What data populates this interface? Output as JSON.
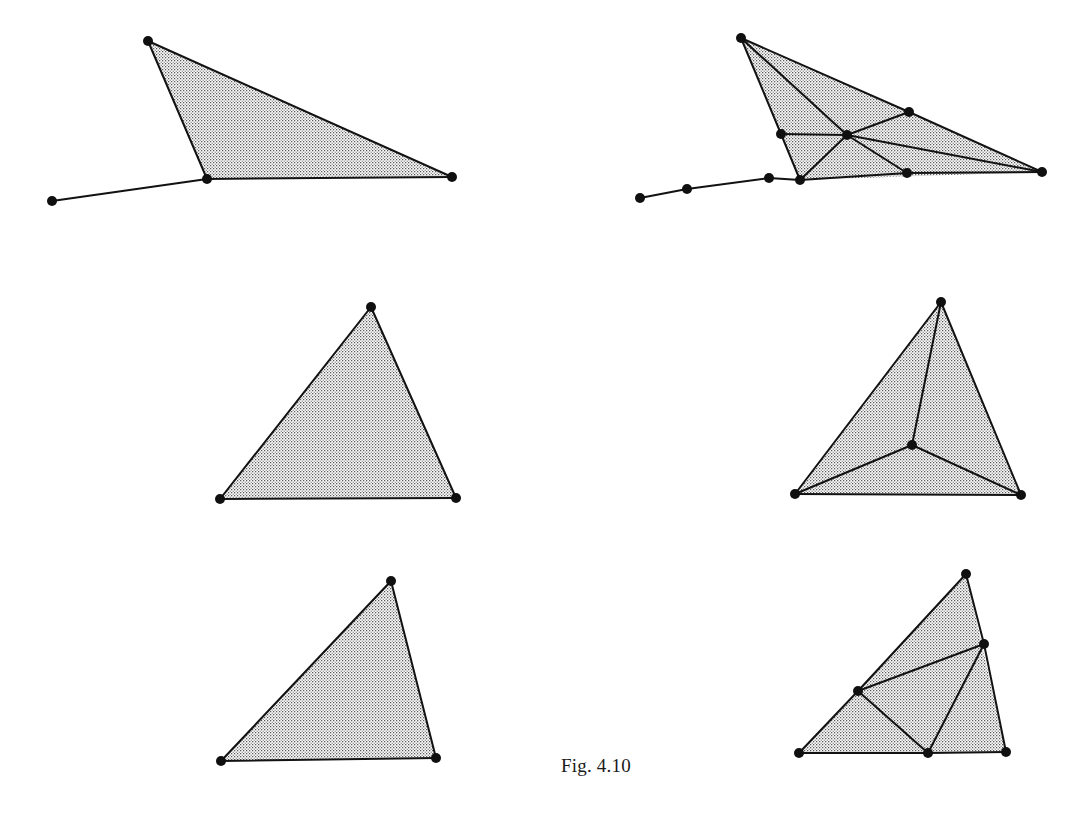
{
  "figure": {
    "caption": "Fig. 4.10",
    "caption_x": 561,
    "caption_y": 755,
    "width": 1075,
    "height": 816,
    "background_color": "#ffffff",
    "edge_color": "#121212",
    "vertex_color": "#101010",
    "fill_pattern": "stipple-dots",
    "fill_dot_color": "#3a3a3a",
    "fill_base_color": "#ffffff",
    "edge_width": 2.0,
    "vertex_radius": 5.0
  },
  "panels": [
    {
      "name": "top-left-coarse-triangle",
      "row": 1,
      "column": "left",
      "kind": "coarse",
      "vertices": [
        {
          "id": "a",
          "x": 148,
          "y": 41
        },
        {
          "id": "b",
          "x": 207,
          "y": 179
        },
        {
          "id": "c",
          "x": 452,
          "y": 177
        },
        {
          "id": "d",
          "x": 52,
          "y": 201
        }
      ],
      "faces": [
        {
          "id": "f1",
          "vertex_ids": [
            "a",
            "b",
            "c"
          ]
        }
      ],
      "edges": [
        {
          "from": "a",
          "to": "b"
        },
        {
          "from": "b",
          "to": "c"
        },
        {
          "from": "c",
          "to": "a"
        },
        {
          "from": "d",
          "to": "b"
        }
      ]
    },
    {
      "name": "top-right-refined-triangle",
      "row": 1,
      "column": "right",
      "kind": "refined",
      "vertices": [
        {
          "id": "a",
          "x": 741,
          "y": 38
        },
        {
          "id": "b",
          "x": 800,
          "y": 180
        },
        {
          "id": "c",
          "x": 1042,
          "y": 172
        },
        {
          "id": "m_ab",
          "x": 781,
          "y": 134
        },
        {
          "id": "m_ac",
          "x": 909,
          "y": 112
        },
        {
          "id": "m_bc",
          "x": 907,
          "y": 173
        },
        {
          "id": "hub",
          "x": 847,
          "y": 135
        },
        {
          "id": "t1",
          "x": 769,
          "y": 178
        },
        {
          "id": "t2",
          "x": 687,
          "y": 189
        },
        {
          "id": "t3",
          "x": 640,
          "y": 198
        }
      ],
      "faces": [
        {
          "id": "f1",
          "vertex_ids": [
            "a",
            "b",
            "c"
          ]
        }
      ],
      "edges": [
        {
          "from": "a",
          "to": "m_ab"
        },
        {
          "from": "m_ab",
          "to": "b"
        },
        {
          "from": "b",
          "to": "m_bc"
        },
        {
          "from": "m_bc",
          "to": "c"
        },
        {
          "from": "c",
          "to": "m_ac"
        },
        {
          "from": "m_ac",
          "to": "a"
        },
        {
          "from": "a",
          "to": "hub"
        },
        {
          "from": "b",
          "to": "hub"
        },
        {
          "from": "c",
          "to": "hub"
        },
        {
          "from": "m_ab",
          "to": "hub"
        },
        {
          "from": "m_ac",
          "to": "hub"
        },
        {
          "from": "m_bc",
          "to": "hub"
        },
        {
          "from": "b",
          "to": "t1"
        },
        {
          "from": "t1",
          "to": "t2"
        },
        {
          "from": "t2",
          "to": "t3"
        }
      ]
    },
    {
      "name": "middle-left-coarse-triangle",
      "row": 2,
      "column": "left",
      "kind": "coarse",
      "vertices": [
        {
          "id": "a",
          "x": 371,
          "y": 307
        },
        {
          "id": "b",
          "x": 220,
          "y": 499
        },
        {
          "id": "c",
          "x": 456,
          "y": 498
        }
      ],
      "faces": [
        {
          "id": "f1",
          "vertex_ids": [
            "a",
            "b",
            "c"
          ]
        }
      ],
      "edges": [
        {
          "from": "a",
          "to": "b"
        },
        {
          "from": "b",
          "to": "c"
        },
        {
          "from": "c",
          "to": "a"
        }
      ]
    },
    {
      "name": "middle-right-refined-triangle",
      "row": 2,
      "column": "right",
      "kind": "refined",
      "vertices": [
        {
          "id": "a",
          "x": 941,
          "y": 302
        },
        {
          "id": "b",
          "x": 795,
          "y": 494
        },
        {
          "id": "c",
          "x": 1021,
          "y": 495
        },
        {
          "id": "g",
          "x": 912,
          "y": 445
        }
      ],
      "faces": [
        {
          "id": "f1",
          "vertex_ids": [
            "a",
            "b",
            "c"
          ]
        }
      ],
      "edges": [
        {
          "from": "a",
          "to": "b"
        },
        {
          "from": "b",
          "to": "c"
        },
        {
          "from": "c",
          "to": "a"
        },
        {
          "from": "a",
          "to": "g"
        },
        {
          "from": "b",
          "to": "g"
        },
        {
          "from": "c",
          "to": "g"
        }
      ]
    },
    {
      "name": "bottom-left-coarse-triangle",
      "row": 3,
      "column": "left",
      "kind": "coarse",
      "vertices": [
        {
          "id": "a",
          "x": 391,
          "y": 581
        },
        {
          "id": "b",
          "x": 221,
          "y": 761
        },
        {
          "id": "c",
          "x": 436,
          "y": 758
        }
      ],
      "faces": [
        {
          "id": "f1",
          "vertex_ids": [
            "a",
            "b",
            "c"
          ]
        }
      ],
      "edges": [
        {
          "from": "a",
          "to": "b"
        },
        {
          "from": "b",
          "to": "c"
        },
        {
          "from": "c",
          "to": "a"
        }
      ]
    },
    {
      "name": "bottom-right-refined-triangle",
      "row": 3,
      "column": "right",
      "kind": "refined",
      "vertices": [
        {
          "id": "a",
          "x": 966,
          "y": 574
        },
        {
          "id": "b",
          "x": 799,
          "y": 753
        },
        {
          "id": "c",
          "x": 1006,
          "y": 752
        },
        {
          "id": "m_ab",
          "x": 858,
          "y": 691
        },
        {
          "id": "m_bc",
          "x": 928,
          "y": 753
        },
        {
          "id": "m_ca",
          "x": 984,
          "y": 644
        }
      ],
      "faces": [
        {
          "id": "f1",
          "vertex_ids": [
            "a",
            "b",
            "c"
          ]
        }
      ],
      "edges": [
        {
          "from": "a",
          "to": "m_ab"
        },
        {
          "from": "m_ab",
          "to": "b"
        },
        {
          "from": "b",
          "to": "m_bc"
        },
        {
          "from": "m_bc",
          "to": "c"
        },
        {
          "from": "c",
          "to": "m_ca"
        },
        {
          "from": "m_ca",
          "to": "a"
        },
        {
          "from": "m_ab",
          "to": "m_ca"
        },
        {
          "from": "m_ab",
          "to": "m_bc"
        },
        {
          "from": "m_bc",
          "to": "m_ca"
        }
      ]
    }
  ]
}
